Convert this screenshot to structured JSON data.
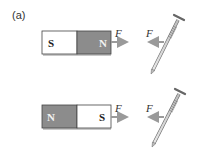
{
  "figure": {
    "panel_label": "(a)",
    "colors": {
      "north_pole": "#8c8c8c",
      "south_pole": "#ffffff",
      "magnet_shadow": "#c8c8c8",
      "arrow": "#9a9a9a",
      "outline": "#444444"
    },
    "rows": [
      {
        "magnet": {
          "left_pole": "S",
          "right_pole": "N"
        },
        "magnet_force_label": "F",
        "nail_force_label": "F"
      },
      {
        "magnet": {
          "left_pole": "N",
          "right_pole": "S"
        },
        "magnet_force_label": "F",
        "nail_force_label": "F"
      }
    ]
  }
}
